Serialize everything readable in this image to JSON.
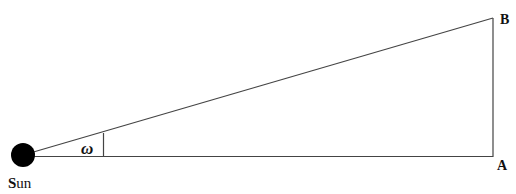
{
  "diagram": {
    "labels": {
      "sun": {
        "first": "S",
        "rest": "un"
      },
      "angle": "ω",
      "point_a": "A",
      "point_b": "B"
    },
    "colors": {
      "line": "#333333",
      "sun_fill": "#000000",
      "background": "#ffffff"
    }
  }
}
